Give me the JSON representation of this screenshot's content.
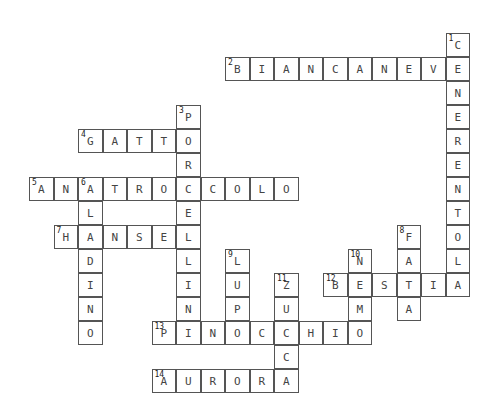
{
  "puzzle": {
    "type": "crossword",
    "cell_width": 24.5,
    "cell_height": 24,
    "origin_x": 29,
    "origin_y": 33,
    "words": [
      {
        "number": 1,
        "answer": "CENERENTOLA",
        "direction": "down",
        "col": 17,
        "row": 0
      },
      {
        "number": 2,
        "answer": "BIANCANEVE",
        "direction": "across",
        "col": 8,
        "row": 1
      },
      {
        "number": 3,
        "answer": "PORCELLINI",
        "direction": "down",
        "col": 6,
        "row": 3
      },
      {
        "number": 4,
        "answer": "GATTO",
        "direction": "across",
        "col": 2,
        "row": 4
      },
      {
        "number": 5,
        "answer": "ANATROCCOLO",
        "direction": "across",
        "col": 0,
        "row": 6
      },
      {
        "number": 6,
        "answer": "ALADINO",
        "direction": "down",
        "col": 2,
        "row": 6
      },
      {
        "number": 7,
        "answer": "HANSEL",
        "direction": "across",
        "col": 1,
        "row": 8
      },
      {
        "number": 8,
        "answer": "FATA",
        "direction": "down",
        "col": 15,
        "row": 8
      },
      {
        "number": 9,
        "answer": "LUPO",
        "direction": "down",
        "col": 8,
        "row": 9
      },
      {
        "number": 10,
        "answer": "NEMO",
        "direction": "down",
        "col": 13,
        "row": 9
      },
      {
        "number": 11,
        "answer": "ZUCCA",
        "direction": "down",
        "col": 10,
        "row": 10
      },
      {
        "number": 12,
        "answer": "BESTIA",
        "direction": "across",
        "col": 12,
        "row": 10
      },
      {
        "number": 13,
        "answer": "PINOCCHIO",
        "direction": "across",
        "col": 5,
        "row": 12
      },
      {
        "number": 14,
        "answer": "AURORA",
        "direction": "across",
        "col": 5,
        "row": 14
      }
    ]
  }
}
